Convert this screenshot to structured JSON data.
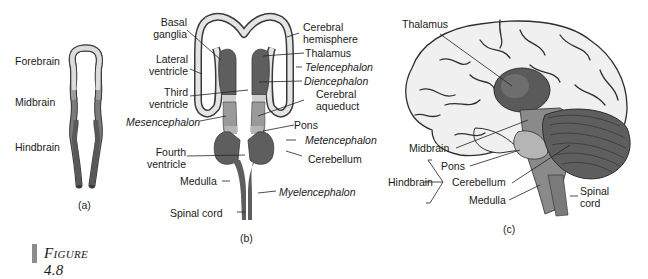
{
  "figure": {
    "caption": "Figure 4.8",
    "colors": {
      "forebrain": "#d9d9d9",
      "midbrain": "#9a9a9a",
      "hindbrain": "#666666",
      "outline": "#3a3a3a",
      "thalamus": "#555555",
      "cerebellum": "#5e5e5e",
      "cortex": "#f2f2f2"
    }
  },
  "panel_a": {
    "label": "(a)",
    "annotations": [
      "Forebrain",
      "Midbrain",
      "Hindbrain"
    ]
  },
  "panel_b": {
    "label": "(b)",
    "left_annotations": [
      "Basal ganglia",
      "Lateral ventricle",
      "Third ventricle",
      "Mesencephalon",
      "Fourth ventricle",
      "Medulla",
      "Spinal cord"
    ],
    "right_annotations": [
      "Cerebral hemisphere",
      "Thalamus",
      "Telencephalon",
      "Diencephalon",
      "Cerebral aqueduct",
      "Pons",
      "Metencephalon",
      "Cerebellum",
      "Myelencephalon"
    ],
    "basal_1": "Basal",
    "basal_2": "ganglia",
    "lateral_1": "Lateral",
    "lateral_2": "ventricle",
    "third_1": "Third",
    "third_2": "ventricle",
    "mesencephalon": "Mesencephalon",
    "fourth_1": "Fourth",
    "fourth_2": "ventricle",
    "medulla": "Medulla",
    "spinal_cord": "Spinal cord",
    "cerebral_1": "Cerebral",
    "cerebral_2": "hemisphere",
    "thalamus": "Thalamus",
    "telencephalon": "Telencephalon",
    "diencephalon": "Diencephalon",
    "aqueduct_1": "Cerebral",
    "aqueduct_2": "aqueduct",
    "pons": "Pons",
    "metencephalon": "Metencephalon",
    "cerebellum": "Cerebellum",
    "myelencephalon": "Myelencephalon"
  },
  "panel_c": {
    "label": "(c)",
    "thalamus": "Thalamus",
    "midbrain": "Midbrain",
    "pons": "Pons",
    "hindbrain": "Hindbrain",
    "cerebellum": "Cerebellum",
    "medulla": "Medulla",
    "spinal_1": "Spinal",
    "spinal_2": "cord"
  }
}
